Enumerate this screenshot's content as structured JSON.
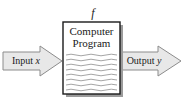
{
  "figure": {
    "type": "block-diagram",
    "title": "",
    "caption_fragment": "",
    "background_color": "#ffffff",
    "function_label": "f",
    "box": {
      "label_line_1": "Computer",
      "label_line_2": "Program",
      "fill_color": "#ffffff",
      "border_color": "#1a1a1a",
      "shadow_color": "#8a8a8a",
      "code_line_count": 8,
      "code_line_color": "#9a9a9a"
    },
    "input_arrow": {
      "label_text": "Input",
      "label_variable": "x",
      "direction": "right",
      "fill_color": "#e8e8e8",
      "border_color": "#8c8c8c"
    },
    "output_arrow": {
      "label_text": "Output",
      "label_variable": "y",
      "direction": "right",
      "fill_color": "#e8e8e8",
      "border_color": "#8c8c8c"
    }
  }
}
